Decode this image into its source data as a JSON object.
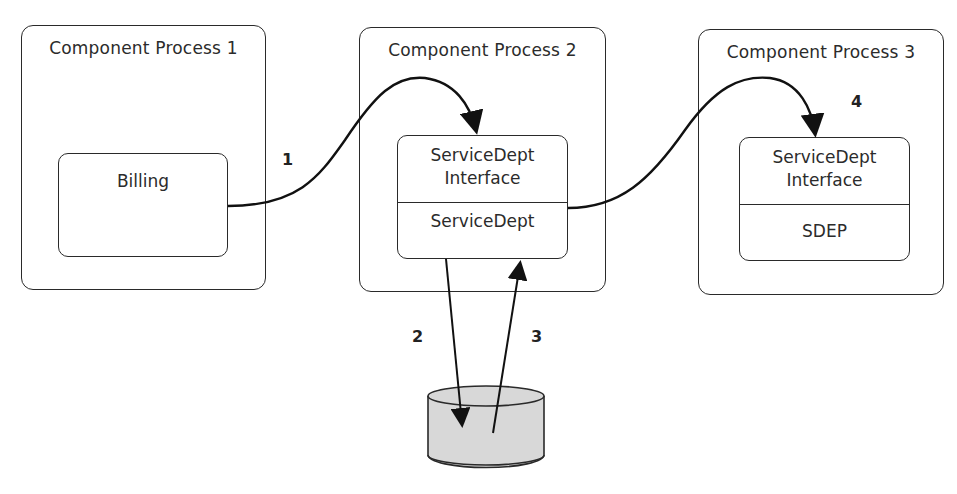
{
  "diagram": {
    "processes": [
      {
        "title": "Component Process 1",
        "component": {
          "sections": [
            "Billing"
          ]
        }
      },
      {
        "title": "Component Process 2",
        "component": {
          "sections": [
            "ServiceDept Interface",
            "ServiceDept"
          ],
          "interface_line1": "ServiceDept",
          "interface_line2": "Interface",
          "impl": "ServiceDept"
        }
      },
      {
        "title": "Component Process 3",
        "component": {
          "sections": [
            "ServiceDept Interface",
            "SDEP"
          ],
          "interface_line1": "ServiceDept",
          "interface_line2": "Interface",
          "impl": "SDEP"
        }
      }
    ],
    "datastore": {
      "shape": "cylinder",
      "fill": "#d8d8d8"
    },
    "steps": [
      {
        "label": "1",
        "from": "Billing",
        "to": "ServiceDept Interface (Process 2)"
      },
      {
        "label": "2",
        "from": "ServiceDept",
        "to": "datastore"
      },
      {
        "label": "3",
        "from": "datastore",
        "to": "ServiceDept"
      },
      {
        "label": "4",
        "from": "ServiceDept",
        "to": "ServiceDept Interface (Process 3)"
      }
    ],
    "colors": {
      "stroke": "#2a2a2a",
      "background": "#ffffff",
      "cylinder": "#d8d8d8"
    }
  }
}
